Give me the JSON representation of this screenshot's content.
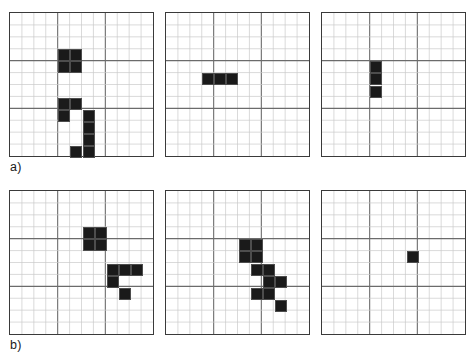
{
  "figure": {
    "background_color": "#ffffff",
    "cell_fill_color": "#1a1a1a",
    "grid_minor_color": "#c9c9c9",
    "grid_major_color": "#6b6b6b",
    "border_color": "#3a3a3a",
    "grid_columns": 12,
    "grid_rows": 12,
    "major_every": 4
  },
  "labels": {
    "row_a": "a)",
    "row_b": "b)"
  },
  "rows": [
    {
      "id": "a",
      "label": "a)",
      "panels": [
        {
          "id": "a1",
          "name": "panel-a-1",
          "filled_count": 10,
          "cells": [
            {
              "col": 4,
              "row": 3
            },
            {
              "col": 5,
              "row": 3
            },
            {
              "col": 4,
              "row": 4
            },
            {
              "col": 5,
              "row": 4
            },
            {
              "col": 4,
              "row": 7
            },
            {
              "col": 5,
              "row": 7
            },
            {
              "col": 4,
              "row": 8
            },
            {
              "col": 6,
              "row": 8
            },
            {
              "col": 6,
              "row": 9
            },
            {
              "col": 6,
              "row": 10
            },
            {
              "col": 5,
              "row": 11
            },
            {
              "col": 6,
              "row": 11
            }
          ]
        },
        {
          "id": "a2",
          "name": "panel-a-2",
          "filled_count": 3,
          "cells": [
            {
              "col": 3,
              "row": 5
            },
            {
              "col": 4,
              "row": 5
            },
            {
              "col": 5,
              "row": 5
            }
          ]
        },
        {
          "id": "a3",
          "name": "panel-a-3",
          "filled_count": 3,
          "cells": [
            {
              "col": 4,
              "row": 4
            },
            {
              "col": 4,
              "row": 5
            },
            {
              "col": 4,
              "row": 6
            }
          ]
        }
      ]
    },
    {
      "id": "b",
      "label": "b)",
      "panels": [
        {
          "id": "b1",
          "name": "panel-b-1",
          "filled_count": 9,
          "cells": [
            {
              "col": 6,
              "row": 3
            },
            {
              "col": 7,
              "row": 3
            },
            {
              "col": 6,
              "row": 4
            },
            {
              "col": 7,
              "row": 4
            },
            {
              "col": 8,
              "row": 6
            },
            {
              "col": 9,
              "row": 6
            },
            {
              "col": 10,
              "row": 6
            },
            {
              "col": 8,
              "row": 7
            },
            {
              "col": 9,
              "row": 8
            }
          ]
        },
        {
          "id": "b2",
          "name": "panel-b-2",
          "filled_count": 9,
          "cells": [
            {
              "col": 6,
              "row": 4
            },
            {
              "col": 7,
              "row": 4
            },
            {
              "col": 6,
              "row": 5
            },
            {
              "col": 7,
              "row": 5
            },
            {
              "col": 7,
              "row": 6
            },
            {
              "col": 8,
              "row": 6
            },
            {
              "col": 8,
              "row": 7
            },
            {
              "col": 9,
              "row": 7
            },
            {
              "col": 7,
              "row": 8
            },
            {
              "col": 8,
              "row": 8
            },
            {
              "col": 9,
              "row": 9
            }
          ]
        },
        {
          "id": "b3",
          "name": "panel-b-3",
          "filled_count": 1,
          "cells": [
            {
              "col": 7,
              "row": 5
            }
          ]
        }
      ]
    }
  ]
}
